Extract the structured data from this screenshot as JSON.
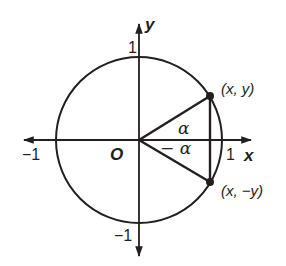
{
  "diagram": {
    "colors": {
      "stroke": "#231f20",
      "background": "#ffffff"
    },
    "axes": {
      "x_label": "x",
      "y_label": "y",
      "origin_label": "O",
      "x_ticks": {
        "neg": "−1",
        "pos": "1"
      },
      "y_ticks": {
        "pos": "1",
        "neg": "−1"
      }
    },
    "points": {
      "p1": "(x, y)",
      "p2": "(x, −y)"
    },
    "angles": {
      "a1": "α",
      "a2": "− α"
    }
  }
}
